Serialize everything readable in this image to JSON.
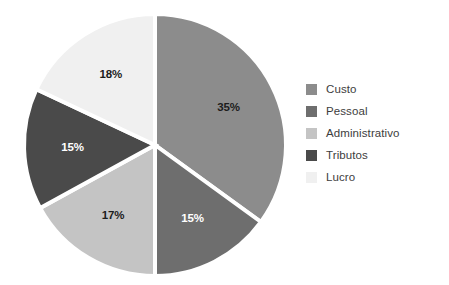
{
  "chart_data": {
    "type": "pie",
    "title": "",
    "subtitle": "",
    "xlabel": "",
    "ylabel": "",
    "grid": false,
    "legend_position": "right",
    "units": "percent",
    "start_angle_deg": 0,
    "direction": "clockwise",
    "categories": [
      "Custo",
      "Pessoal",
      "Administrativo",
      "Tributos",
      "Lucro"
    ],
    "values": [
      35,
      15,
      17,
      15,
      18
    ],
    "data_labels": [
      "35%",
      "15%",
      "17%",
      "15%",
      "18%"
    ],
    "colors": [
      "#8c8c8c",
      "#6e6e6e",
      "#c4c4c4",
      "#4a4a4a",
      "#f0f0f0"
    ],
    "label_colors": [
      "#1c1c1c",
      "#ffffff",
      "#1c1c1c",
      "#ffffff",
      "#1c1c1c"
    ],
    "slices": [
      {
        "label": "Custo",
        "value": 35,
        "display": "35%",
        "color": "#8c8c8c",
        "label_color": "#1c1c1c"
      },
      {
        "label": "Pessoal",
        "value": 15,
        "display": "15%",
        "color": "#6e6e6e",
        "label_color": "#ffffff"
      },
      {
        "label": "Administrativo",
        "value": 17,
        "display": "17%",
        "color": "#c4c4c4",
        "label_color": "#1c1c1c"
      },
      {
        "label": "Tributos",
        "value": 15,
        "display": "15%",
        "color": "#4a4a4a",
        "label_color": "#ffffff"
      },
      {
        "label": "Lucro",
        "value": 18,
        "display": "18%",
        "color": "#f0f0f0",
        "label_color": "#1c1c1c"
      }
    ]
  },
  "legend": {
    "items": [
      {
        "label": "Custo",
        "color": "#8c8c8c"
      },
      {
        "label": "Pessoal",
        "color": "#6e6e6e"
      },
      {
        "label": "Administrativo",
        "color": "#c4c4c4"
      },
      {
        "label": "Tributos",
        "color": "#4a4a4a"
      },
      {
        "label": "Lucro",
        "color": "#f0f0f0"
      }
    ]
  },
  "geometry": {
    "center_x": 155,
    "center_y": 145,
    "radius": 131,
    "separator_color": "#ffffff",
    "separator_width": 4
  },
  "background": "#ffffff"
}
